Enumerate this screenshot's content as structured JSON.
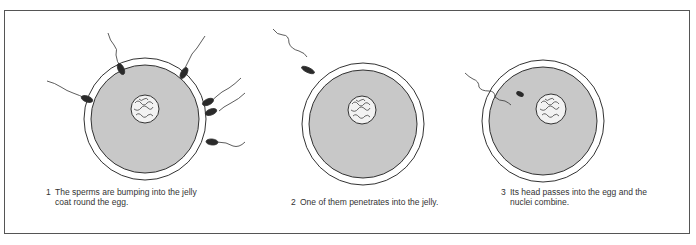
{
  "figure": {
    "panels": [
      {
        "number": "1",
        "caption": "The sperms are bumping into the jelly\ncoat round the egg."
      },
      {
        "number": "2",
        "caption": "One of them penetrates into the jelly."
      },
      {
        "number": "3",
        "caption": "Its head passes into the egg and the\nnuclei combine."
      }
    ],
    "labels": {
      "jelly_coat": "jelly coat",
      "egg": "egg",
      "nucleus": "nucleus",
      "sperm": "sperm"
    },
    "colors": {
      "cytoplasm": "#c8c8c8",
      "jelly": "#ffffff",
      "outline": "#333333",
      "sperm_head": "#2a2a2a"
    }
  }
}
